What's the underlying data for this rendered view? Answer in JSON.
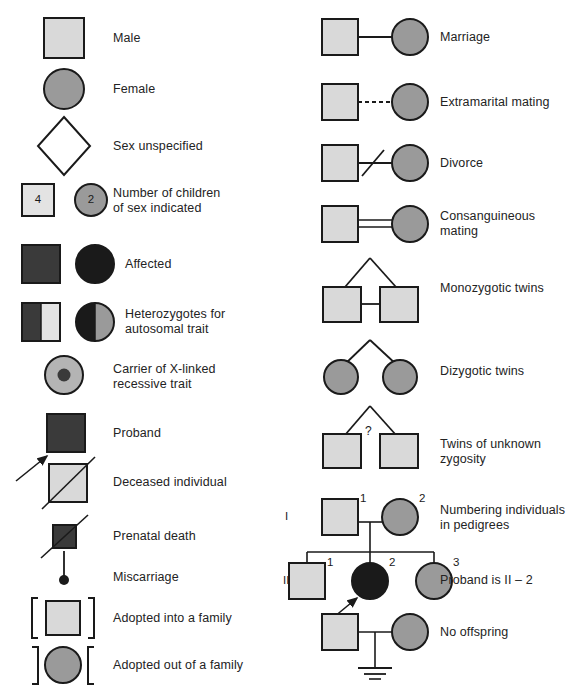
{
  "figure": {
    "width": 577,
    "height": 695,
    "caption": ""
  },
  "colors": {
    "light_gray_fill": "#d9d9d9",
    "mid_gray_fill": "#9a9a9a",
    "dark_fill": "#3a3a3a",
    "black_fill": "#1a1a1a",
    "pale_fill": "#e3e3e3",
    "stroke": "#1a1a1a",
    "background": "#ffffff",
    "text": "#232323"
  },
  "left_column": {
    "items": [
      {
        "key": "male",
        "label": "Male",
        "symbol": "square-light"
      },
      {
        "key": "female",
        "label": "Female",
        "symbol": "circle-gray"
      },
      {
        "key": "sex-unspecified",
        "label": "Sex unspecified",
        "symbol": "diamond-white"
      },
      {
        "key": "number-of-children",
        "label": "Number of children\nof sex indicated",
        "symbol": "square-and-circle-with-counts",
        "square_count": "4",
        "circle_count": "2"
      },
      {
        "key": "affected",
        "label": "Affected",
        "symbol": "square-dark-and-circle-black"
      },
      {
        "key": "heterozygotes",
        "label": "Heterozygotes for\nautosomal trait",
        "symbol": "half-filled-square-and-circle"
      },
      {
        "key": "carrier-x-linked",
        "label": "Carrier of X-linked\nrecessive trait",
        "symbol": "circle-with-dot"
      },
      {
        "key": "proband",
        "label": "Proband",
        "symbol": "dark-square-with-arrow"
      },
      {
        "key": "deceased",
        "label": "Deceased individual",
        "symbol": "square-with-slash"
      },
      {
        "key": "prenatal-death",
        "label": "Prenatal death",
        "symbol": "small-dark-square-with-slash"
      },
      {
        "key": "miscarriage",
        "label": "Miscarriage",
        "symbol": "dot-on-stem"
      },
      {
        "key": "adopted-in",
        "label": "Adopted into a family",
        "symbol": "square-in-brackets"
      },
      {
        "key": "adopted-out",
        "label": "Adopted out of a family",
        "symbol": "circle-in-reversed-brackets"
      }
    ]
  },
  "right_column": {
    "items": [
      {
        "key": "marriage",
        "label": "Marriage",
        "symbol": "square-line-circle"
      },
      {
        "key": "extramarital-mating",
        "label": "Extramarital mating",
        "symbol": "square-dashedline-circle"
      },
      {
        "key": "divorce",
        "label": "Divorce",
        "symbol": "square-line-slash-circle"
      },
      {
        "key": "consanguineous-mating",
        "label": "Consanguineous\nmating",
        "symbol": "square-doubleline-circle"
      },
      {
        "key": "monozygotic-twins",
        "label": "Monozygotic twins",
        "symbol": "twins-connected"
      },
      {
        "key": "dizygotic-twins",
        "label": "Dizygotic twins",
        "symbol": "twins-circles"
      },
      {
        "key": "twins-unknown-zygosity",
        "label": "Twins of unknown\nzygosity",
        "symbol": "twins-question",
        "question_mark": "?"
      },
      {
        "key": "numbering-individuals",
        "label": "Numbering individuals\nin pedigrees",
        "symbol": "pedigree-generation-1"
      },
      {
        "key": "proband-is",
        "label": "Proband is II – 2",
        "symbol": "pedigree-generation-2"
      },
      {
        "key": "no-offspring",
        "label": "No offspring",
        "symbol": "couple-with-no-offspring-bar"
      }
    ]
  },
  "pedigree_example": {
    "generation_labels": [
      "I",
      "II"
    ],
    "generation_1": [
      {
        "id": "I-1",
        "number": "1",
        "sex": "male",
        "status": "unaffected"
      },
      {
        "id": "I-2",
        "number": "2",
        "sex": "female",
        "status": "unaffected"
      }
    ],
    "generation_2": [
      {
        "id": "II-1",
        "number": "1",
        "sex": "male",
        "status": "unaffected"
      },
      {
        "id": "II-2",
        "number": "2",
        "sex": "female",
        "status": "affected",
        "proband": true
      },
      {
        "id": "II-3",
        "number": "3",
        "sex": "female",
        "status": "unaffected"
      }
    ]
  }
}
